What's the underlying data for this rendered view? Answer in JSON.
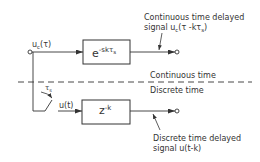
{
  "diagram": {
    "colors": {
      "line": "#333333",
      "background": "#ffffff"
    },
    "input": {
      "label_main": "u",
      "label_sub": "c",
      "label_arg": "(τ)"
    },
    "continuous_block": {
      "base": "e",
      "exponent": "-skτ",
      "exponent_sub": "s"
    },
    "discrete_block": {
      "base": "z",
      "exponent": "-k"
    },
    "sampler": {
      "period_label": "τ",
      "period_sub": "s"
    },
    "discrete_signal_label": "u(t)",
    "boundary": {
      "upper_label": "Continuous time",
      "lower_label": "Discrete time"
    },
    "continuous_output": {
      "line1": "Continuous time delayed",
      "line2_prefix": "signal u",
      "line2_sub": "c",
      "line2_arg": "(τ -kτ",
      "line2_sub2": "s",
      "line2_end": ")"
    },
    "discrete_output": {
      "line1": "Discrete time delayed",
      "line2": "signal u(t-k)"
    }
  }
}
